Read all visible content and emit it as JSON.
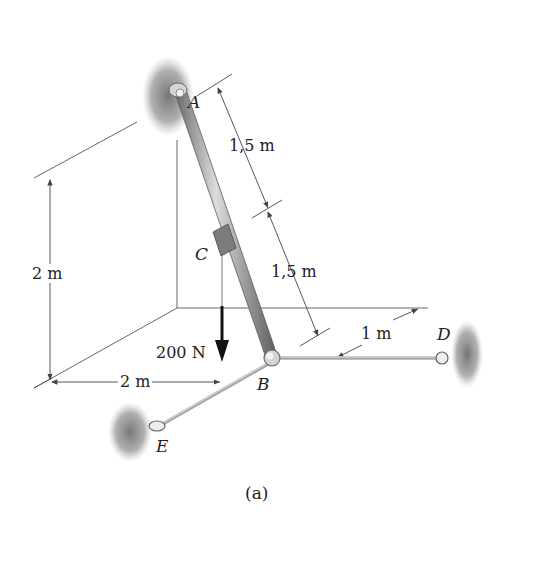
{
  "figure": {
    "caption": "(a)",
    "points": {
      "A": "A",
      "B": "B",
      "C": "C",
      "D": "D",
      "E": "E"
    },
    "dimensions": {
      "AC": "1,5 m",
      "CB": "1,5 m",
      "BD_offset": "1 m",
      "height": "2 m",
      "depth": "2 m"
    },
    "load": {
      "label": "200 N",
      "direction": "down",
      "applied_at": "C"
    },
    "colors": {
      "rod": "#9a9a9a",
      "rod_highlight": "#d8d8d8",
      "cable": "#b5b5b5",
      "wall_shadow": "#8c8c8c",
      "dim_line": "#444444",
      "load_arrow": "#111111"
    }
  }
}
